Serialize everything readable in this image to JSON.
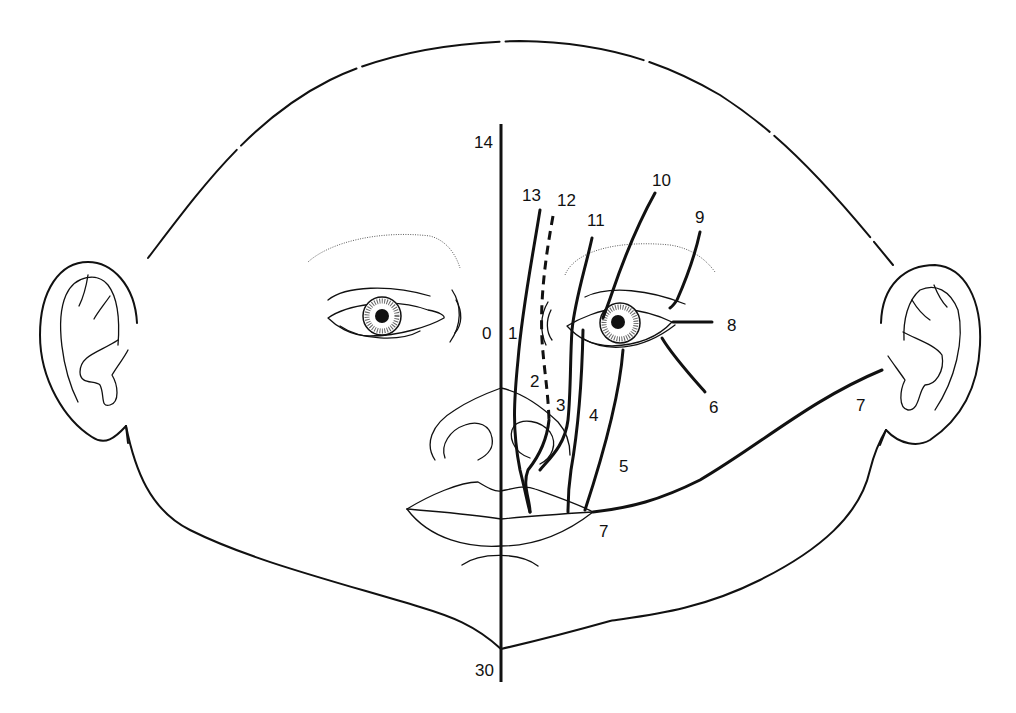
{
  "diagram": {
    "colors": {
      "line": "#111111",
      "background": "#ffffff"
    },
    "midline": {
      "top_label": "14",
      "bottom_label": "30"
    },
    "cleft_labels": {
      "c0": "0",
      "c1": "1",
      "c2": "2",
      "c3": "3",
      "c4": "4",
      "c5": "5",
      "c6": "6",
      "c7_cheek": "7",
      "c7_mouth": "7",
      "c8": "8",
      "c9": "9",
      "c10": "10",
      "c11": "11",
      "c12": "12",
      "c13": "13",
      "c14": "14",
      "c30": "30"
    },
    "line_styles": {
      "cleft_12": "dashed",
      "cleft_2_3": "dashed",
      "others": "solid"
    }
  }
}
